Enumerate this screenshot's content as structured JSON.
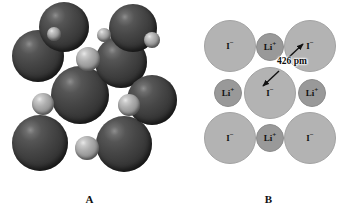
{
  "figure": {
    "background_color": "#ffffff",
    "width": 358,
    "height": 211
  },
  "panel_a": {
    "caption": "A",
    "description": "Space-filling model of the lithium iodide unit cell",
    "iodide_color": "#3a3a3a",
    "lithium_color": "#a8a8a8",
    "spheres": [
      {
        "ion": "iodide",
        "cx": 64,
        "cy": 27,
        "r": 25
      },
      {
        "ion": "iodide",
        "cx": 133,
        "cy": 28,
        "r": 24
      },
      {
        "ion": "iodide",
        "cx": 38,
        "cy": 56,
        "r": 26
      },
      {
        "ion": "iodide",
        "cx": 121,
        "cy": 62,
        "r": 26
      },
      {
        "ion": "iodide",
        "cx": 80,
        "cy": 95,
        "r": 29
      },
      {
        "ion": "iodide",
        "cx": 152,
        "cy": 100,
        "r": 25
      },
      {
        "ion": "iodide",
        "cx": 40,
        "cy": 143,
        "r": 28
      },
      {
        "ion": "iodide",
        "cx": 124,
        "cy": 144,
        "r": 28
      },
      {
        "ion": "lithium",
        "cx": 54,
        "cy": 34,
        "r": 7
      },
      {
        "ion": "lithium",
        "cx": 104,
        "cy": 35,
        "r": 7
      },
      {
        "ion": "lithium",
        "cx": 152,
        "cy": 40,
        "r": 8
      },
      {
        "ion": "lithium",
        "cx": 88,
        "cy": 59,
        "r": 12
      },
      {
        "ion": "lithium",
        "cx": 43,
        "cy": 104,
        "r": 11
      },
      {
        "ion": "lithium",
        "cx": 129,
        "cy": 105,
        "r": 11
      },
      {
        "ion": "lithium",
        "cx": 87,
        "cy": 148,
        "r": 12
      }
    ]
  },
  "panel_b": {
    "caption": "B",
    "description": "Cross-section of the lithium iodide structure showing ion contact",
    "iodide_color": "#b3b3b3",
    "lithium_color": "#999999",
    "ion_labels": {
      "iodide": "I",
      "iodide_charge": "−",
      "lithium": "Li",
      "lithium_charge": "+"
    },
    "distance": {
      "value": "426",
      "unit": "pm",
      "text": "426 pm"
    },
    "ions": [
      {
        "id": "i-top-left",
        "ion": "iodide",
        "cx": 50,
        "cy": 45,
        "r": 25
      },
      {
        "id": "i-top-right",
        "ion": "iodide",
        "cx": 130,
        "cy": 45,
        "r": 25
      },
      {
        "id": "i-center",
        "ion": "iodide",
        "cx": 90,
        "cy": 92,
        "r": 25
      },
      {
        "id": "i-bottom-left",
        "ion": "iodide",
        "cx": 50,
        "cy": 137,
        "r": 25
      },
      {
        "id": "i-bottom-right",
        "ion": "iodide",
        "cx": 130,
        "cy": 137,
        "r": 25
      },
      {
        "id": "li-top",
        "ion": "lithium",
        "cx": 90,
        "cy": 46,
        "r": 13
      },
      {
        "id": "li-left",
        "ion": "lithium",
        "cx": 48,
        "cy": 92,
        "r": 13
      },
      {
        "id": "li-right",
        "ion": "lithium",
        "cx": 132,
        "cy": 92,
        "r": 13
      },
      {
        "id": "li-bottom",
        "ion": "lithium",
        "cx": 90,
        "cy": 137,
        "r": 13
      }
    ]
  }
}
